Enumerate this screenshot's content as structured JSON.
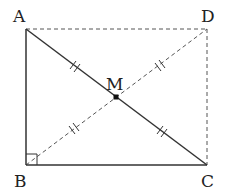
{
  "diagram": {
    "title": "",
    "points": {
      "A": {
        "label": "A"
      },
      "B": {
        "label": "B"
      },
      "C": {
        "label": "C"
      },
      "D": {
        "label": "D"
      },
      "M": {
        "label": "M"
      }
    },
    "segments": [
      {
        "from": "A",
        "to": "B",
        "style": "solid"
      },
      {
        "from": "B",
        "to": "C",
        "style": "solid"
      },
      {
        "from": "A",
        "to": "C",
        "style": "solid"
      },
      {
        "from": "A",
        "to": "D",
        "style": "dashed"
      },
      {
        "from": "D",
        "to": "C",
        "style": "dashed"
      },
      {
        "from": "B",
        "to": "D",
        "style": "dashed"
      }
    ],
    "right_angle_at": "B",
    "equal_marks": "double-tick on AM, MC, BM, MD",
    "midpoint": "M"
  }
}
